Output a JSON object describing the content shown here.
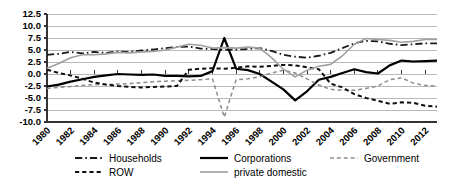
{
  "chart_data": {
    "type": "line",
    "title": "",
    "xlabel": "",
    "ylabel": "",
    "ylim": [
      -10.0,
      12.5
    ],
    "xlim": [
      1980,
      2013
    ],
    "grid": true,
    "legend_position": "bottom",
    "yticks": [
      "12.5",
      "10.0",
      "7.5",
      "5.0",
      "2.5",
      "0.0",
      "-2.5",
      "-5.0",
      "-7.5",
      "-10.0"
    ],
    "ytick_values": [
      12.5,
      10.0,
      7.5,
      5.0,
      2.5,
      0.0,
      -2.5,
      -5.0,
      -7.5,
      -10.0
    ],
    "xticks": [
      "1980",
      "1982",
      "1984",
      "1986",
      "1988",
      "1990",
      "1992",
      "1994",
      "1996",
      "1998",
      "2000",
      "2002",
      "2004",
      "2006",
      "2008",
      "2010",
      "2012"
    ],
    "xtick_values": [
      1980,
      1982,
      1984,
      1986,
      1988,
      1990,
      1992,
      1994,
      1996,
      1998,
      2000,
      2002,
      2004,
      2006,
      2008,
      2010,
      2012
    ],
    "x": [
      1980,
      1981,
      1982,
      1983,
      1984,
      1985,
      1986,
      1987,
      1988,
      1989,
      1990,
      1991,
      1992,
      1993,
      1994,
      1995,
      1996,
      1997,
      1998,
      1999,
      2000,
      2001,
      2002,
      2003,
      2004,
      2005,
      2006,
      2007,
      2008,
      2009,
      2010,
      2011,
      2012,
      2013
    ],
    "series": [
      {
        "name": "Households",
        "style": "dashdot",
        "color": "#1a1a1a",
        "width": 1.8,
        "values": [
          4.0,
          4.2,
          4.6,
          4.3,
          4.6,
          4.4,
          4.7,
          4.6,
          4.9,
          5.1,
          5.4,
          5.6,
          5.7,
          5.3,
          5.2,
          5.0,
          5.1,
          5.2,
          5.4,
          4.8,
          4.0,
          3.6,
          3.4,
          3.8,
          4.4,
          5.4,
          6.4,
          6.9,
          6.8,
          6.3,
          6.0,
          6.2,
          6.4,
          6.4
        ]
      },
      {
        "name": "Corporations",
        "style": "solid",
        "color": "#000000",
        "width": 2.2,
        "values": [
          -2.6,
          -2.2,
          -1.6,
          -1.1,
          -0.6,
          -0.3,
          0.0,
          -0.1,
          -0.2,
          -0.1,
          -0.4,
          -0.4,
          -0.5,
          -0.4,
          0.6,
          7.5,
          1.1,
          0.8,
          0.0,
          -1.6,
          -3.2,
          -5.5,
          -3.6,
          -1.2,
          -0.6,
          0.2,
          1.0,
          0.4,
          0.1,
          1.8,
          2.8,
          2.6,
          2.7,
          2.8
        ]
      },
      {
        "name": "Government",
        "style": "dashed-gray",
        "color": "#8c8c8c",
        "width": 1.5,
        "values": [
          -3.0,
          -2.8,
          -2.6,
          -2.4,
          -2.2,
          -2.2,
          -2.1,
          -2.0,
          -1.8,
          -1.6,
          -1.5,
          -1.4,
          -1.3,
          -1.2,
          -1.0,
          -9.0,
          -1.2,
          -1.0,
          -0.6,
          0.2,
          0.8,
          0.2,
          -1.0,
          -2.3,
          -3.2,
          -3.4,
          -3.4,
          -3.0,
          -2.5,
          -1.2,
          -0.8,
          -1.9,
          -2.4,
          -2.5
        ]
      },
      {
        "name": "ROW",
        "style": "dashed",
        "color": "#111111",
        "width": 2.0,
        "values": [
          0.9,
          0.2,
          -0.3,
          -1.0,
          -1.8,
          -2.2,
          -2.5,
          -2.7,
          -2.8,
          -2.7,
          -2.6,
          -2.5,
          0.9,
          1.1,
          1.2,
          1.1,
          1.3,
          1.6,
          1.5,
          1.7,
          1.9,
          1.8,
          1.4,
          1.0,
          -2.0,
          -2.8,
          -4.2,
          -5.0,
          -5.6,
          -6.2,
          -5.9,
          -6.0,
          -6.6,
          -6.8
        ]
      },
      {
        "name": "private domestic",
        "style": "solid-gray",
        "color": "#a0a0a0",
        "width": 1.6,
        "values": [
          1.2,
          2.2,
          3.4,
          4.0,
          4.0,
          4.2,
          4.5,
          4.4,
          4.6,
          4.7,
          5.0,
          5.6,
          6.2,
          6.0,
          5.4,
          5.5,
          5.4,
          5.6,
          5.4,
          3.4,
          1.0,
          -0.6,
          0.8,
          1.6,
          2.0,
          3.8,
          6.2,
          7.4,
          7.2,
          7.0,
          6.6,
          6.8,
          7.2,
          7.2
        ]
      }
    ],
    "legend": [
      {
        "label": "Households",
        "style": "dashdot",
        "color": "#1a1a1a"
      },
      {
        "label": "Corporations",
        "style": "solid",
        "color": "#000000"
      },
      {
        "label": "Government",
        "style": "dashed-gray",
        "color": "#8c8c8c"
      },
      {
        "label": "ROW",
        "style": "dashed",
        "color": "#111111"
      },
      {
        "label": "private domestic",
        "style": "solid-gray",
        "color": "#a0a0a0"
      }
    ]
  },
  "axes": {
    "gridline_color": "#b9b9b9",
    "axis_color": "#333333"
  }
}
